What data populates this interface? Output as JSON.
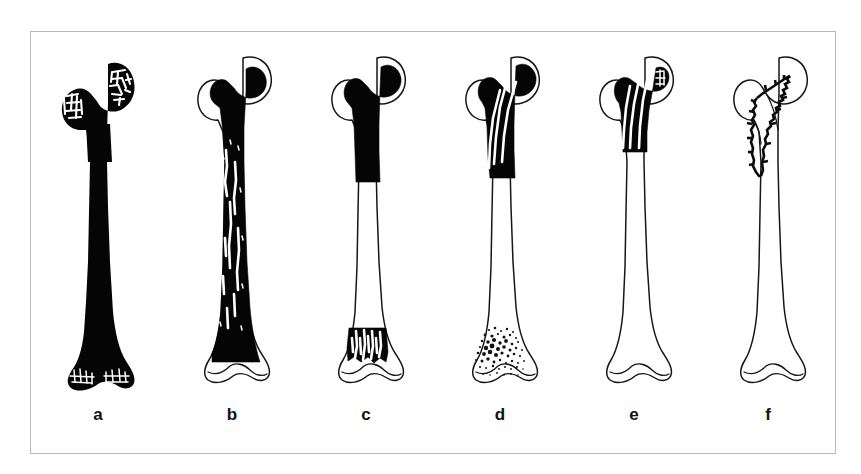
{
  "figure": {
    "background_color": "#ffffff",
    "frame_border_color": "#b9b9b9",
    "ink_color": "#0b0b0b",
    "panel_count": 6,
    "panels": [
      {
        "label": "a",
        "name": "femur-diagram-a",
        "description": "Proximal femur with entire bone densely filled black; trabecular lattice visible as white mesh in femoral head, greater trochanter and distal condyles",
        "involvement": "whole-bone",
        "fill_extent_percent": 100
      },
      {
        "label": "b",
        "name": "femur-diagram-b",
        "description": "Femur black from head through diaphysis with longitudinal white streaks in shaft; distal condyles left as outline only",
        "involvement": "head-to-distal-metaphysis",
        "fill_extent_percent": 85
      },
      {
        "label": "c",
        "name": "femur-diagram-c",
        "description": "Black proximal third plus separate black distal metaphyseal band with vertical white striations; mid-shaft outline only",
        "involvement": "proximal-third-and-distal-metaphysis",
        "fill_extent_percent": 45
      },
      {
        "label": "d",
        "name": "femur-diagram-d",
        "description": "Black proximal metaphysis crossed by oblique white lines; distal metaphysis shown as fine stippled speckle",
        "involvement": "proximal-metaphysis-with-distal-stippling",
        "fill_extent_percent": 35
      },
      {
        "label": "e",
        "name": "femur-diagram-e",
        "description": "Black confined to femoral neck and intertrochanteric region with white striations; rest of bone outline only",
        "involvement": "neck-and-intertrochanteric",
        "fill_extent_percent": 20
      },
      {
        "label": "f",
        "name": "femur-diagram-f",
        "description": "Outline femur only, with a narrow V-shaped serrated fracture/lesion line in the femoral neck and subtrochanteric region",
        "involvement": "neck-lesion-line-only",
        "fill_extent_percent": 5
      }
    ]
  }
}
